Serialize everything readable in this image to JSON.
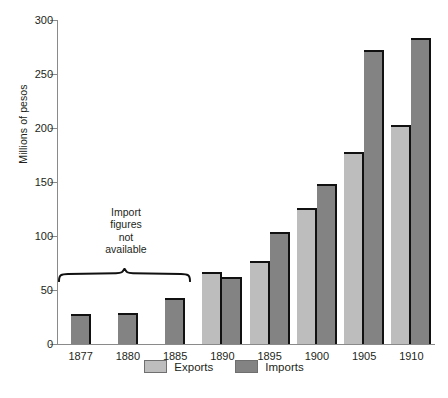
{
  "chart_data": {
    "type": "bar",
    "title": "",
    "xlabel": "",
    "ylabel": "Millions of pesos",
    "ylim": [
      0,
      300
    ],
    "ytick_values": [
      0,
      50,
      100,
      150,
      200,
      250,
      300
    ],
    "ytick_labels": [
      "0",
      "50",
      "100",
      "150",
      "200",
      "250",
      "300"
    ],
    "grid": false,
    "categories": [
      "1877",
      "1880",
      "1885",
      "1890",
      "1895",
      "1900",
      "1905",
      "1910"
    ],
    "series": [
      {
        "name": "Exports",
        "color": "#bdbdbd",
        "values": [
          null,
          null,
          null,
          67,
          77,
          126,
          178,
          203
        ]
      },
      {
        "name": "Imports",
        "color": "#838383",
        "values": [
          28,
          29,
          43,
          62,
          104,
          148,
          272,
          283
        ]
      }
    ],
    "annotations": [
      {
        "text": "Import figures not available",
        "lines": [
          "Import",
          "figures",
          "not",
          "available"
        ],
        "covers_categories": [
          "1877",
          "1880",
          "1885"
        ],
        "marker": "curly-brace"
      }
    ],
    "legend": {
      "position": "bottom-center",
      "entries": [
        {
          "label": "Exports",
          "color": "#bdbdbd"
        },
        {
          "label": "Imports",
          "color": "#838383"
        }
      ]
    },
    "note": "For 1877, 1880 and 1885 only a single bar is drawn; it uses the Imports (dark) fill but the brace annotation states import figures are not available for those years."
  },
  "axis": {
    "y_label": "Millions of pesos",
    "ticks": [
      "300",
      "250",
      "200",
      "150",
      "100",
      "50",
      "0"
    ]
  },
  "legend": {
    "exports_label": "Exports",
    "imports_label": "Imports"
  },
  "annotation": {
    "line1": "Import",
    "line2": "figures",
    "line3": "not",
    "line4": "available"
  },
  "categories": [
    "1877",
    "1880",
    "1885",
    "1890",
    "1895",
    "1900",
    "1905",
    "1910"
  ],
  "colors": {
    "exports": "#bdbdbd",
    "imports": "#838383",
    "axis": "#8a8a8a",
    "text": "#231f20",
    "bar_edge": "#111111"
  }
}
